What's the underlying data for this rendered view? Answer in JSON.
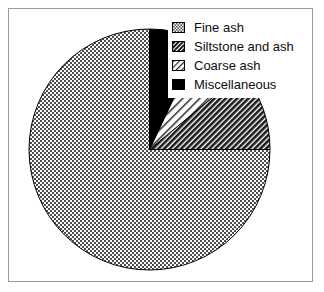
{
  "chart_data": {
    "type": "pie",
    "title": "",
    "legend_position": "top-right",
    "start_angle_deg": 90,
    "direction": "counterclockwise",
    "categories": [
      "Fine ash",
      "Siltstone and ash",
      "Coarse ash",
      "Miscellaneous"
    ],
    "values": [
      75,
      11,
      7,
      7
    ],
    "units": "percent",
    "slices": [
      {
        "label": "Fine ash",
        "value": 75,
        "fill": "stipple",
        "color": "#808080"
      },
      {
        "label": "Siltstone and ash",
        "value": 11,
        "fill": "dense-diagonal-hatch",
        "color": "#3a3a3a"
      },
      {
        "label": "Coarse ash",
        "value": 7,
        "fill": "sparse-diagonal-hatch",
        "color": "#d9d9d9"
      },
      {
        "label": "Miscellaneous",
        "value": 7,
        "fill": "solid",
        "color": "#000000"
      }
    ],
    "xlabel": "",
    "ylabel": ""
  },
  "legend": {
    "items": [
      {
        "label": "Fine ash",
        "swatch": "stipple-swatch"
      },
      {
        "label": "Siltstone and ash",
        "swatch": "dense-hatch-swatch"
      },
      {
        "label": "Coarse ash",
        "swatch": "sparse-hatch-swatch"
      },
      {
        "label": "Miscellaneous",
        "swatch": "solid-black-swatch"
      }
    ]
  },
  "colors": {
    "frame": "#9a9a9a",
    "outline": "#000000",
    "background": "#ffffff"
  }
}
